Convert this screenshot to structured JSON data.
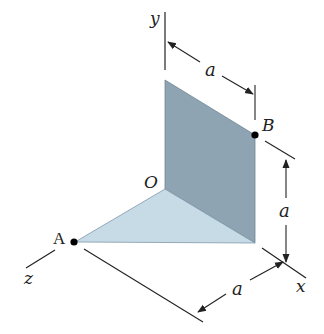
{
  "diagram": {
    "type": "3d-geometry",
    "colors": {
      "vertical_plate": "#8fa4b3",
      "horizontal_plate": "#c6dbe6",
      "line": "#222222",
      "point": "#000000"
    },
    "axes": {
      "x_label": "x",
      "y_label": "y",
      "z_label": "z"
    },
    "points": {
      "origin_label": "O",
      "a_label": "A",
      "b_label": "B"
    },
    "dimensions": [
      {
        "id": "top",
        "label": "a",
        "description": "distance from y-axis to B along x"
      },
      {
        "id": "right",
        "label": "a",
        "description": "height of B above x-axis"
      },
      {
        "id": "bottom",
        "label": "a",
        "description": "distance from A along x to x-axis end"
      }
    ]
  }
}
